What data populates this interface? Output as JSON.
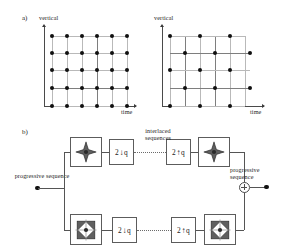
{
  "figure": {
    "panel_a": {
      "tag": "a)",
      "left_plot": {
        "y_axis_label": "vertical",
        "x_axis_label": "time",
        "sampling": "progressive",
        "cols": 6,
        "rows": 5,
        "dots_per_row": [
          6,
          6,
          6,
          6,
          6
        ]
      },
      "right_plot": {
        "y_axis_label": "vertical",
        "x_axis_label": "time",
        "sampling": "interlaced",
        "cols": 6,
        "rows": 5,
        "dot_columns_odd_rows": [
          1,
          3,
          5
        ],
        "dot_columns_even_rows": [
          2,
          4,
          6
        ]
      }
    },
    "panel_b": {
      "tag": "b)",
      "input_label": "progressive sequence",
      "middle_label": "interlaced sequences",
      "output_label": "progressive sequence",
      "branches": [
        {
          "id": "upper",
          "analysis_filter_icon": "diamond-lowpass-filter-icon",
          "decimator_prefix": "2",
          "decimator_arrow": "↓",
          "decimator_suffix": "q",
          "interpolator_prefix": "2",
          "interpolator_arrow": "↑",
          "interpolator_suffix": "q",
          "synthesis_filter_icon": "diamond-lowpass-filter-icon"
        },
        {
          "id": "lower",
          "analysis_filter_icon": "diamond-highpass-filter-icon",
          "decimator_prefix": "2",
          "decimator_arrow": "↓",
          "decimator_suffix": "q",
          "interpolator_prefix": "2",
          "interpolator_arrow": "↑",
          "interpolator_suffix": "q",
          "synthesis_filter_icon": "diamond-highpass-filter-icon"
        }
      ],
      "summing_node": "+"
    },
    "colors": {
      "ink": "#1a1a1a",
      "dot": "#101010",
      "wire": "#555555",
      "gridline": "#b9b9b9",
      "gridline_strong": "#7e7e7e",
      "box_border": "#5c5c5c",
      "filter_fill": "#6b6b6b"
    }
  }
}
